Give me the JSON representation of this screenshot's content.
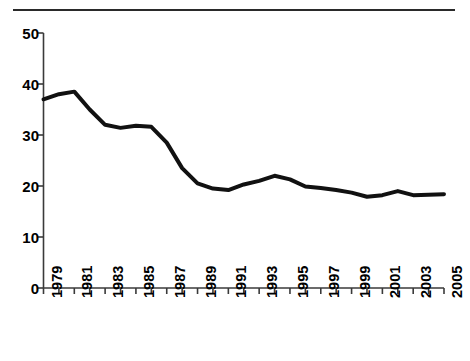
{
  "figure": {
    "top_rule": "horizontal-rule",
    "caption_text": ""
  },
  "chart_data": {
    "type": "line",
    "title": "",
    "subtitle": "",
    "xlabel": "",
    "ylabel": "",
    "xlim": [
      1979,
      2005
    ],
    "ylim": [
      0,
      50
    ],
    "grid": false,
    "legend": "none",
    "y_ticks": [
      0,
      10,
      20,
      30,
      40,
      50
    ],
    "y_tick_labels": [
      "0",
      "10",
      "20",
      "30",
      "40",
      "50"
    ],
    "x_ticks": [
      1979,
      1980,
      1981,
      1982,
      1983,
      1984,
      1985,
      1986,
      1987,
      1988,
      1989,
      1990,
      1991,
      1992,
      1993,
      1994,
      1995,
      1996,
      1997,
      1998,
      1999,
      2000,
      2001,
      2002,
      2003,
      2004,
      2005
    ],
    "x_tick_labels": [
      "1979",
      "",
      "1981",
      "",
      "1983",
      "",
      "1985",
      "",
      "1987",
      "",
      "1989",
      "",
      "1991",
      "",
      "1993",
      "",
      "1995",
      "",
      "1997",
      "",
      "1999",
      "",
      "2001",
      "",
      "2003",
      "",
      "2005"
    ],
    "x_labels_visible": [
      "1979",
      "1981",
      "1983",
      "1985",
      "1987",
      "1989",
      "1991",
      "1993",
      "1995",
      "1997",
      "1999",
      "2001",
      "2003",
      "2005"
    ],
    "x_label_rotation_deg": 90,
    "series": [
      {
        "name": "rate",
        "color": "#111111",
        "line_width": 4,
        "x": [
          1979,
          1980,
          1981,
          1982,
          1983,
          1984,
          1985,
          1986,
          1987,
          1988,
          1989,
          1990,
          1991,
          1992,
          1993,
          1994,
          1995,
          1996,
          1997,
          1998,
          1999,
          2000,
          2001,
          2002,
          2003,
          2004,
          2005
        ],
        "values": [
          37.0,
          38.0,
          38.5,
          35.0,
          32.0,
          31.4,
          31.8,
          31.6,
          28.5,
          23.5,
          20.5,
          19.5,
          19.2,
          20.3,
          21.0,
          22.0,
          21.3,
          19.9,
          19.6,
          19.2,
          18.7,
          17.9,
          18.2,
          19.0,
          18.2,
          18.3,
          18.4
        ]
      }
    ]
  }
}
